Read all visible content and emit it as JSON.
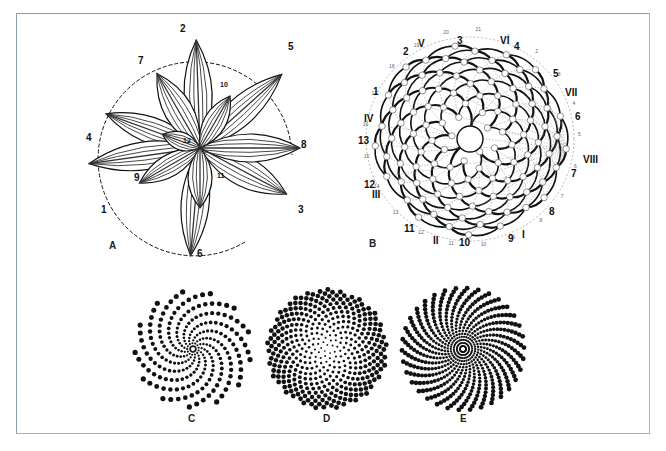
{
  "figure": {
    "frame_color": "#8d9bb3",
    "background": "#ffffff",
    "ink_color": "#111111"
  },
  "panel_a": {
    "label": "A",
    "description": "Rosette of leaves arranged in a spiral with leaf numbers and a dashed generative spiral",
    "leaf_labels": [
      {
        "text": "1",
        "x": 101,
        "y": 213
      },
      {
        "text": "2",
        "x": 180,
        "y": 32
      },
      {
        "text": "3",
        "x": 298,
        "y": 213
      },
      {
        "text": "4",
        "x": 86,
        "y": 141
      },
      {
        "text": "5",
        "x": 288,
        "y": 50
      },
      {
        "text": "6",
        "x": 197,
        "y": 257
      },
      {
        "text": "7",
        "x": 138,
        "y": 64
      },
      {
        "text": "8",
        "x": 301,
        "y": 148
      },
      {
        "text": "9",
        "x": 134,
        "y": 181
      },
      {
        "text": "10",
        "x": 220,
        "y": 87
      },
      {
        "text": "11",
        "x": 217,
        "y": 178
      },
      {
        "text": "12",
        "x": 183,
        "y": 143
      }
    ]
  },
  "panel_b": {
    "label": "B",
    "description": "Capitulum with florets numbered in order, contact parastichies indicated by arabic (13) and roman (8) numerals",
    "arabic_labels": [
      {
        "text": "1",
        "x": 373,
        "y": 95
      },
      {
        "text": "2",
        "x": 403,
        "y": 55
      },
      {
        "text": "3",
        "x": 457,
        "y": 44
      },
      {
        "text": "4",
        "x": 514,
        "y": 50
      },
      {
        "text": "5",
        "x": 553,
        "y": 77
      },
      {
        "text": "6",
        "x": 575,
        "y": 120
      },
      {
        "text": "7",
        "x": 571,
        "y": 177
      },
      {
        "text": "8",
        "x": 549,
        "y": 215
      },
      {
        "text": "9",
        "x": 508,
        "y": 242
      },
      {
        "text": "10",
        "x": 459,
        "y": 246
      },
      {
        "text": "11",
        "x": 404,
        "y": 232
      },
      {
        "text": "12",
        "x": 364,
        "y": 188
      },
      {
        "text": "13",
        "x": 358,
        "y": 144
      }
    ],
    "roman_labels": [
      {
        "text": "I",
        "x": 522,
        "y": 238
      },
      {
        "text": "II",
        "x": 433,
        "y": 244
      },
      {
        "text": "III",
        "x": 372,
        "y": 198
      },
      {
        "text": "IV",
        "x": 364,
        "y": 122
      },
      {
        "text": "V",
        "x": 418,
        "y": 47
      },
      {
        "text": "VI",
        "x": 500,
        "y": 44
      },
      {
        "text": "VII",
        "x": 565,
        "y": 96
      },
      {
        "text": "VIII",
        "x": 583,
        "y": 163
      }
    ],
    "outer_floret_numbers": [
      "1",
      "2",
      "3",
      "4",
      "5",
      "6",
      "7",
      "8",
      "9",
      "10",
      "11",
      "12",
      "13",
      "14",
      "15",
      "16",
      "17",
      "18",
      "19",
      "20",
      "21"
    ],
    "center": {
      "x": 470,
      "y": 139
    },
    "radius": 104
  },
  "panel_c": {
    "label": "C",
    "description": "Dot spiral with few strongly curved arms",
    "center": {
      "x": 193,
      "y": 349
    },
    "arms": 13,
    "dots_per_arm": 20,
    "radius": 58,
    "twist": 2.6,
    "dot_radius": 2.6
  },
  "panel_d": {
    "label": "D",
    "description": "Phyllotactic golden-angle dot pattern",
    "center": {
      "x": 327,
      "y": 349
    },
    "count": 420,
    "divergence_angle_deg": 137.508,
    "radius": 60,
    "dot_radius": 2.5
  },
  "panel_e": {
    "label": "E",
    "description": "Dot spiral with many nearly radial arms",
    "center": {
      "x": 463,
      "y": 349
    },
    "arms": 34,
    "dots_per_arm": 20,
    "radius": 61,
    "twist": 0.9,
    "dot_radius": 2.4
  }
}
